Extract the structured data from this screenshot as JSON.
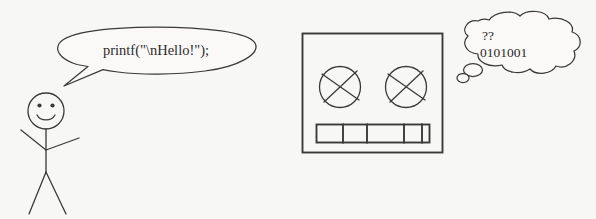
{
  "scene": {
    "title": "Stick figure programmer and computer cartoon",
    "background_color": "#f7f7f5",
    "ink_color": "#3a3a3a",
    "width": 596,
    "height": 219
  },
  "speech_bubble": {
    "name": "speech-bubble",
    "speaker": "stick-figure",
    "code_line": "printf(\"\\nHello!\");"
  },
  "stick_figure": {
    "name": "stick-figure",
    "expression": "smiling",
    "parts": [
      "head",
      "left-eye",
      "right-eye",
      "smile",
      "torso",
      "left-arm",
      "right-arm",
      "left-leg",
      "right-leg"
    ]
  },
  "computer": {
    "name": "computer-box",
    "left_reel_label": "left-tape-reel",
    "right_reel_label": "right-tape-reel",
    "slot_bar_label": "card-slot-bar",
    "slot_segments": 5
  },
  "thought_bubble": {
    "name": "thought-bubble",
    "thinker": "computer-box",
    "line_1": "??",
    "line_2": "0101001"
  }
}
